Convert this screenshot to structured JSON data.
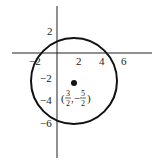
{
  "diagram": {
    "type": "circle-on-axes",
    "center": {
      "x": 1.5,
      "y": -2.5,
      "label_num_x": "3",
      "label_den_x": "2",
      "label_num_y": "5",
      "label_den_y": "2",
      "label_open": "(",
      "label_comma": ",−",
      "label_close": ")"
    },
    "x_ticks": [
      {
        "value": -2,
        "label": "−2"
      },
      {
        "value": 2,
        "label": "2"
      },
      {
        "value": 4,
        "label": "4"
      },
      {
        "value": 6,
        "label": "6"
      }
    ],
    "y_ticks": [
      {
        "value": 2,
        "label": "2"
      },
      {
        "value": -2,
        "label": "−2"
      },
      {
        "value": -4,
        "label": "−4"
      },
      {
        "value": -6,
        "label": "−6"
      }
    ]
  }
}
